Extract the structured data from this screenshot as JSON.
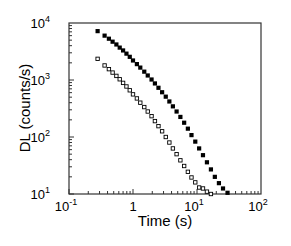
{
  "chart_data": {
    "type": "scatter",
    "title": "",
    "xlabel": "Time (s)",
    "ylabel": "DL (counts/s)",
    "xscale": "log",
    "yscale": "log",
    "xlim": [
      0.1,
      100
    ],
    "ylim": [
      10,
      10000
    ],
    "grid": false,
    "legend": null,
    "x_ticks": [
      {
        "base": "10",
        "exp": "-1",
        "value": 0.1
      },
      {
        "base": "1",
        "exp": "",
        "value": 1
      },
      {
        "base": "10",
        "exp": "1",
        "value": 10
      },
      {
        "base": "10",
        "exp": "2",
        "value": 100
      }
    ],
    "y_ticks": [
      {
        "base": "10",
        "exp": "1",
        "value": 10
      },
      {
        "base": "10",
        "exp": "2",
        "value": 100
      },
      {
        "base": "10",
        "exp": "3",
        "value": 1000
      },
      {
        "base": "10",
        "exp": "4",
        "value": 10000
      }
    ],
    "series": [
      {
        "name": "filled squares",
        "marker": "filled-square",
        "color": "#000000",
        "points": [
          [
            0.28,
            7200
          ],
          [
            0.36,
            6000
          ],
          [
            0.42,
            5300
          ],
          [
            0.48,
            4700
          ],
          [
            0.55,
            4200
          ],
          [
            0.62,
            3700
          ],
          [
            0.7,
            3300
          ],
          [
            0.79,
            2900
          ],
          [
            0.89,
            2550
          ],
          [
            1.0,
            2200
          ],
          [
            1.15,
            1900
          ],
          [
            1.3,
            1650
          ],
          [
            1.5,
            1400
          ],
          [
            1.7,
            1200
          ],
          [
            1.95,
            1020
          ],
          [
            2.2,
            870
          ],
          [
            2.5,
            730
          ],
          [
            2.85,
            610
          ],
          [
            3.25,
            510
          ],
          [
            3.7,
            420
          ],
          [
            4.2,
            345
          ],
          [
            4.8,
            280
          ],
          [
            5.5,
            225
          ],
          [
            6.3,
            178
          ],
          [
            7.2,
            140
          ],
          [
            8.2,
            108
          ],
          [
            9.4,
            83
          ],
          [
            10.8,
            63
          ],
          [
            12.4,
            48
          ],
          [
            14.3,
            36
          ],
          [
            16.5,
            27
          ],
          [
            19.0,
            20
          ],
          [
            22.0,
            15.5
          ],
          [
            25.5,
            12.5
          ],
          [
            30,
            10.5
          ]
        ]
      },
      {
        "name": "open squares",
        "marker": "open-square",
        "color": "#000000",
        "points": [
          [
            0.28,
            2350
          ],
          [
            0.36,
            1800
          ],
          [
            0.42,
            1550
          ],
          [
            0.48,
            1350
          ],
          [
            0.55,
            1180
          ],
          [
            0.62,
            1030
          ],
          [
            0.7,
            890
          ],
          [
            0.79,
            770
          ],
          [
            0.89,
            660
          ],
          [
            1.0,
            560
          ],
          [
            1.15,
            475
          ],
          [
            1.3,
            400
          ],
          [
            1.5,
            335
          ],
          [
            1.7,
            280
          ],
          [
            1.95,
            232
          ],
          [
            2.2,
            190
          ],
          [
            2.5,
            155
          ],
          [
            2.85,
            126
          ],
          [
            3.25,
            100
          ],
          [
            3.7,
            80
          ],
          [
            4.2,
            63
          ],
          [
            4.8,
            50
          ],
          [
            5.5,
            39
          ],
          [
            6.3,
            31
          ],
          [
            7.2,
            24.5
          ],
          [
            8.2,
            19.5
          ],
          [
            9.4,
            16
          ],
          [
            10.8,
            13
          ],
          [
            12.4,
            12.5
          ],
          [
            14.3,
            11
          ],
          [
            16.5,
            10
          ]
        ]
      }
    ]
  }
}
